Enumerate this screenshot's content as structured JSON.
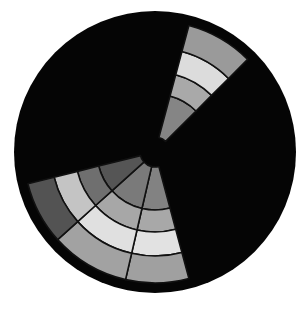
{
  "diagram": {
    "type": "radial-segment-diagram",
    "canvas": {
      "width": 308,
      "height": 309,
      "background": "#ffffff"
    },
    "disc": {
      "cx": 155,
      "cy": 152,
      "r": 141,
      "fill": "#050505"
    },
    "ring_radii": [
      15,
      58,
      80,
      104,
      131
    ],
    "separator_color": "#111111",
    "wedges": [
      {
        "id": "top-wedge",
        "start_deg": 15,
        "end_deg": 45,
        "ring_colors": [
          "#858585",
          "#a9a9a9",
          "#dcdcdc",
          "#9a9a9a"
        ]
      },
      {
        "id": "lower-right-wedge",
        "start_deg": 165,
        "end_deg": 193,
        "ring_colors": [
          "#828282",
          "#a8a8a8",
          "#e2e2e2",
          "#a0a0a0"
        ]
      },
      {
        "id": "lower-middle-wedge",
        "start_deg": 193,
        "end_deg": 228,
        "ring_colors": [
          "#7a7a7a",
          "#a7a7a7",
          "#e0e0e0",
          "#a2a2a2"
        ]
      },
      {
        "id": "lower-left-wedge",
        "start_deg": 228,
        "end_deg": 256,
        "ring_colors": [
          "#555555",
          "#6f6f6f",
          "#c4c4c4",
          "#535353"
        ]
      }
    ]
  }
}
